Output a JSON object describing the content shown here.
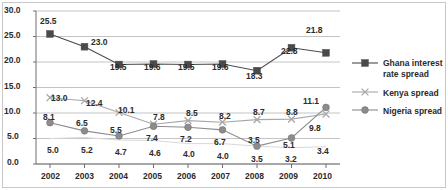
{
  "chart_data": {
    "type": "line",
    "title": "",
    "xlabel": "",
    "ylabel": "",
    "categories": [
      "2002",
      "2003",
      "2004",
      "2005",
      "2006",
      "2007",
      "2008",
      "2009",
      "2010"
    ],
    "ylim": [
      0.0,
      30.0
    ],
    "ytick_labels": [
      "0.0",
      "5.0",
      "10.0",
      "15.0",
      "20.0",
      "25.0",
      "30.0"
    ],
    "ytick_values": [
      0,
      5,
      10,
      15,
      20,
      25,
      30
    ],
    "grid": "horizontal",
    "legend_position": "right",
    "series": [
      {
        "name": "Ghana interest rate spread",
        "marker": "square",
        "color": "#4a4a4a",
        "values": [
          25.5,
          23.0,
          19.5,
          19.6,
          19.5,
          19.6,
          18.3,
          22.8,
          21.8
        ],
        "labels": [
          "25.5",
          "23.0",
          "19.5",
          "19.6",
          "19.5",
          "19.6",
          "18.3",
          "22.8",
          "21.8"
        ]
      },
      {
        "name": "Kenya spread",
        "marker": "cross",
        "color": "#a8a8a8",
        "values": [
          13.0,
          12.4,
          10.1,
          7.8,
          8.5,
          8.2,
          8.7,
          8.8,
          9.8
        ],
        "labels": [
          "13.0",
          "12.4",
          "10.1",
          "7.8",
          "8.5",
          "8.2",
          "8.7",
          "8.8",
          "9.8"
        ]
      },
      {
        "name": "Nigeria spread",
        "marker": "circle",
        "color": "#8c8c8c",
        "values": [
          8.1,
          6.5,
          5.5,
          7.4,
          7.2,
          6.7,
          3.5,
          5.1,
          11.1
        ],
        "labels": [
          "8.1",
          "6.5",
          "5.5",
          "7.4",
          "7.2",
          "6.7",
          "3.5",
          "5.1",
          "11.1"
        ]
      },
      {
        "name": "",
        "marker": "none",
        "color": "#d9d9d9",
        "values": [
          5.0,
          5.2,
          4.7,
          4.6,
          4.0,
          4.0,
          3.5,
          3.2,
          3.4
        ],
        "labels": [
          "5.0",
          "5.2",
          "4.7",
          "4.6",
          "4.0",
          "4.0",
          "3.5",
          "3.2",
          "3.4"
        ]
      }
    ]
  },
  "legend": {
    "items": [
      {
        "label_line1": "Ghana interest",
        "label_line2": "rate spread",
        "marker": "square-marker"
      },
      {
        "label_line1": "Kenya spread",
        "label_line2": "",
        "marker": "cross-marker"
      },
      {
        "label_line1": "Nigeria spread",
        "label_line2": "",
        "marker": "circle-marker"
      }
    ]
  },
  "axis": {
    "y_ticks": [
      "30.0",
      "25.0",
      "20.0",
      "15.0",
      "10.0",
      "5.0",
      "0.0"
    ],
    "x_ticks": [
      "2002",
      "2003",
      "2004",
      "2005",
      "2006",
      "2007",
      "2008",
      "2009",
      "2010"
    ]
  },
  "point_labels": {
    "ghana": [
      {
        "text": "25.5",
        "x": 40,
        "y": 17
      },
      {
        "text": "23.0",
        "x": 91,
        "y": 38
      },
      {
        "text": "19.5",
        "x": 110,
        "y": 63
      },
      {
        "text": "19.6",
        "x": 144,
        "y": 63
      },
      {
        "text": "19.5",
        "x": 178,
        "y": 63
      },
      {
        "text": "19.6",
        "x": 212,
        "y": 63
      },
      {
        "text": "18.3",
        "x": 246,
        "y": 72
      },
      {
        "text": "22.8",
        "x": 281,
        "y": 47
      },
      {
        "text": "21.8",
        "x": 306,
        "y": 26
      }
    ],
    "kenya": [
      {
        "text": "13.0",
        "x": 51,
        "y": 94
      },
      {
        "text": "12.4",
        "x": 86,
        "y": 99
      },
      {
        "text": "10.1",
        "x": 118,
        "y": 106
      },
      {
        "text": "7.8",
        "x": 153,
        "y": 113
      },
      {
        "text": "8.5",
        "x": 186,
        "y": 109
      },
      {
        "text": "8.2",
        "x": 219,
        "y": 112
      },
      {
        "text": "8.7",
        "x": 253,
        "y": 108
      },
      {
        "text": "8.8",
        "x": 286,
        "y": 108
      },
      {
        "text": "9.8",
        "x": 309,
        "y": 124
      }
    ],
    "nigeria": [
      {
        "text": "8.1",
        "x": 43,
        "y": 113
      },
      {
        "text": "6.5",
        "x": 76,
        "y": 119
      },
      {
        "text": "5.5",
        "x": 110,
        "y": 126
      },
      {
        "text": "7.4",
        "x": 146,
        "y": 134
      },
      {
        "text": "7.2",
        "x": 180,
        "y": 135
      },
      {
        "text": "6.7",
        "x": 214,
        "y": 138
      },
      {
        "text": "3.5",
        "x": 248,
        "y": 136
      },
      {
        "text": "5.1",
        "x": 283,
        "y": 141
      },
      {
        "text": "11.1",
        "x": 303,
        "y": 97
      }
    ],
    "fourth": [
      {
        "text": "5.0",
        "x": 47,
        "y": 146
      },
      {
        "text": "5.2",
        "x": 81,
        "y": 146
      },
      {
        "text": "4.7",
        "x": 115,
        "y": 148
      },
      {
        "text": "4.6",
        "x": 149,
        "y": 149
      },
      {
        "text": "4.0",
        "x": 183,
        "y": 150
      },
      {
        "text": "4.0",
        "x": 217,
        "y": 152
      },
      {
        "text": "3.5",
        "x": 251,
        "y": 155
      },
      {
        "text": "3.2",
        "x": 285,
        "y": 155
      },
      {
        "text": "3.4",
        "x": 317,
        "y": 147
      }
    ]
  }
}
